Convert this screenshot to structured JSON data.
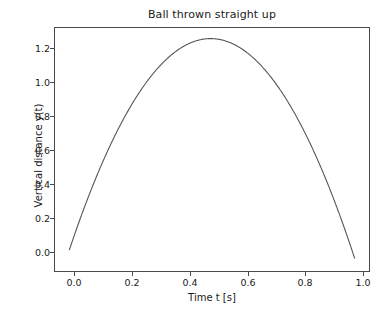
{
  "chart_data": {
    "type": "line",
    "title": "Ball thrown straight up",
    "xlabel": "Time t [s]",
    "ylabel": "Vertical distance y(t)",
    "xlim": [
      -0.052,
      1.082
    ],
    "ylim": [
      -0.128,
      1.338
    ],
    "grid": false,
    "legend": null,
    "xticks": [
      0.0,
      0.2,
      0.4,
      0.6,
      0.8,
      1.0
    ],
    "xtick_labels": [
      "0.0",
      "0.2",
      "0.4",
      "0.6",
      "0.8",
      "1.0"
    ],
    "yticks": [
      0.0,
      0.2,
      0.4,
      0.6,
      0.8,
      1.0,
      1.2
    ],
    "ytick_labels": [
      "0.0",
      "0.2",
      "0.4",
      "0.6",
      "0.8",
      "1.0",
      "1.2"
    ],
    "series": [
      {
        "name": "y(t)",
        "color": "#555555",
        "linewidth": 1.0,
        "formula": "y = v0*t - 0.5*g*t^2, v0 = 5 m/s, g = 9.81 m/s^2",
        "peak_value": 1.274,
        "peak_time": 0.51,
        "x": [
          0.0,
          0.0515,
          0.103,
          0.1545,
          0.206,
          0.2575,
          0.309,
          0.3605,
          0.412,
          0.4635,
          0.515,
          0.5665,
          0.618,
          0.6695,
          0.721,
          0.7725,
          0.824,
          0.8755,
          0.927,
          0.9785,
          1.03
        ],
        "values": [
          0.0,
          0.244,
          0.463,
          0.658,
          0.822,
          0.962,
          1.077,
          1.163,
          1.227,
          1.264,
          1.274,
          1.259,
          1.217,
          1.149,
          1.056,
          0.937,
          0.791,
          0.619,
          0.421,
          0.197,
          -0.052
        ]
      }
    ]
  }
}
